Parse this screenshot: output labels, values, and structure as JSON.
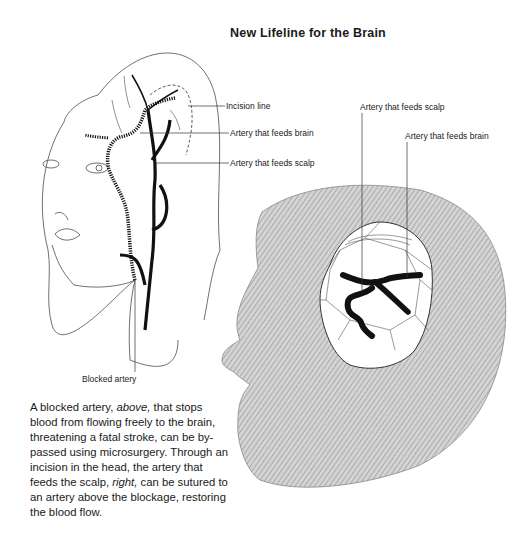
{
  "title": "New Lifeline for the Brain",
  "left_figure": {
    "labels": {
      "incision_line": "Incision line",
      "artery_brain": "Artery that feeds brain",
      "artery_scalp": "Artery that feeds scalp",
      "blocked_artery": "Blocked artery"
    }
  },
  "right_figure": {
    "labels": {
      "artery_scalp": "Artery that feeds scalp",
      "artery_brain": "Artery that feeds brain"
    }
  },
  "caption": {
    "part1": "A blocked artery, ",
    "above": "above,",
    "part2": " that stops blood from flowing freely to the brain, threatening a fatal stroke, can be by-passed using microsurgery. Through an incision in the head, the artery that feeds the scalp, ",
    "right": "right,",
    "part3": " can be sutured to an artery above the blockage, restoring the blood flow."
  },
  "colors": {
    "ink": "#1a1a1a",
    "hatch": "#9a9a9a"
  }
}
